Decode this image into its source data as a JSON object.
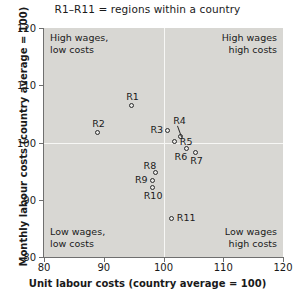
{
  "chart_data": {
    "type": "scatter",
    "title": "R1–R11 = regions within a country",
    "xlabel": "Unit labour costs (country average = 100)",
    "ylabel": "Monthly labour costs (country average = 100)",
    "xlim": [
      80,
      120
    ],
    "ylim": [
      80,
      120
    ],
    "xticks": [
      "80",
      "90",
      "100",
      "110",
      "120"
    ],
    "yticks": [
      "80",
      "90",
      "100",
      "110",
      "120"
    ],
    "xtick_values": [
      80,
      90,
      100,
      110,
      120
    ],
    "ytick_values": [
      80,
      90,
      100,
      110,
      120
    ],
    "grid": true,
    "gridlines": {
      "x": [
        100
      ],
      "y": [
        100
      ],
      "color": "#f7f7f5"
    },
    "legend": "none",
    "plot_background": "#d8d7d3",
    "marker_color": "#2a2a2a",
    "points": [
      {
        "name": "R1",
        "x": 94.7,
        "y": 106.5,
        "label_pos": "above"
      },
      {
        "name": "R2",
        "x": 89.0,
        "y": 101.8,
        "label_pos": "above"
      },
      {
        "name": "R3",
        "x": 100.7,
        "y": 102.1,
        "label_pos": "left"
      },
      {
        "name": "R4",
        "x": 102.9,
        "y": 101.0,
        "label_pos": "above-leader"
      },
      {
        "name": "R5",
        "x": 101.9,
        "y": 100.1,
        "label_pos": "right"
      },
      {
        "name": "R6",
        "x": 103.9,
        "y": 99.0,
        "label_pos": "below-left"
      },
      {
        "name": "R7",
        "x": 105.4,
        "y": 98.3,
        "label_pos": "below"
      },
      {
        "name": "R8",
        "x": 98.7,
        "y": 94.7,
        "label_pos": "above-left"
      },
      {
        "name": "R9",
        "x": 98.1,
        "y": 93.4,
        "label_pos": "left"
      },
      {
        "name": "R10",
        "x": 98.1,
        "y": 92.2,
        "label_pos": "below"
      },
      {
        "name": "R11",
        "x": 101.4,
        "y": 86.8,
        "label_pos": "right"
      }
    ],
    "annotations": [
      {
        "id": "top-left",
        "text": "High wages,\nlow costs"
      },
      {
        "id": "top-right",
        "text": "High wages\nhigh costs"
      },
      {
        "id": "bottom-left",
        "text": "Low wages,\nlow costs"
      },
      {
        "id": "bottom-right",
        "text": "Low wages\nhigh costs"
      }
    ]
  }
}
